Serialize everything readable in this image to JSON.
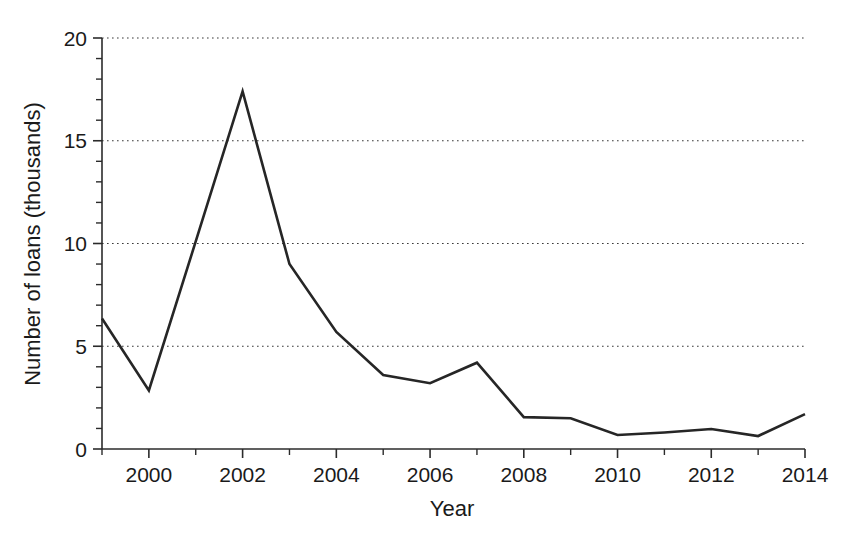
{
  "chart_data": {
    "type": "line",
    "title": "",
    "subtitle": "",
    "xlabel": "Year",
    "ylabel": "Number of loans (thousands)",
    "x": [
      1999,
      2000,
      2001,
      2002,
      2003,
      2004,
      2005,
      2006,
      2007,
      2008,
      2009,
      2010,
      2011,
      2012,
      2013,
      2014
    ],
    "values": [
      6.35,
      2.85,
      10.1,
      17.4,
      9.0,
      5.7,
      3.6,
      3.2,
      4.2,
      1.55,
      1.5,
      0.68,
      0.8,
      0.97,
      0.63,
      1.7
    ],
    "series": [
      {
        "name": "Number of loans",
        "values": [
          6.35,
          2.85,
          10.1,
          17.4,
          9.0,
          5.7,
          3.6,
          3.2,
          4.2,
          1.55,
          1.5,
          0.68,
          0.8,
          0.97,
          0.63,
          1.7
        ]
      }
    ],
    "xlim": [
      1999,
      2014
    ],
    "ylim": [
      0,
      20
    ],
    "x_tick_labels": [
      "2000",
      "2002",
      "2004",
      "2006",
      "2008",
      "2010",
      "2012",
      "2014"
    ],
    "x_tick_values": [
      2000,
      2002,
      2004,
      2006,
      2008,
      2010,
      2012,
      2014
    ],
    "x_minor_tick_values": [
      1999,
      2001,
      2003,
      2005,
      2007,
      2009,
      2011,
      2013
    ],
    "y_tick_labels": [
      "0",
      "5",
      "10",
      "15",
      "20"
    ],
    "y_tick_values": [
      0,
      5,
      10,
      15,
      20
    ],
    "y_minor_tick_values": [
      1,
      2,
      3,
      4,
      6,
      7,
      8,
      9,
      11,
      12,
      13,
      14,
      16,
      17,
      18,
      19
    ],
    "grid": {
      "horizontal": true,
      "vertical": false,
      "style": "dotted",
      "at_values": [
        5,
        10,
        15,
        20
      ]
    },
    "legend": {
      "visible": false,
      "position": "none",
      "entries": []
    },
    "annotations": [],
    "line_color": "#262626",
    "background_color": "#ffffff"
  },
  "axes": {
    "x_axis_name": "year-axis",
    "y_axis_name": "loans-axis"
  }
}
